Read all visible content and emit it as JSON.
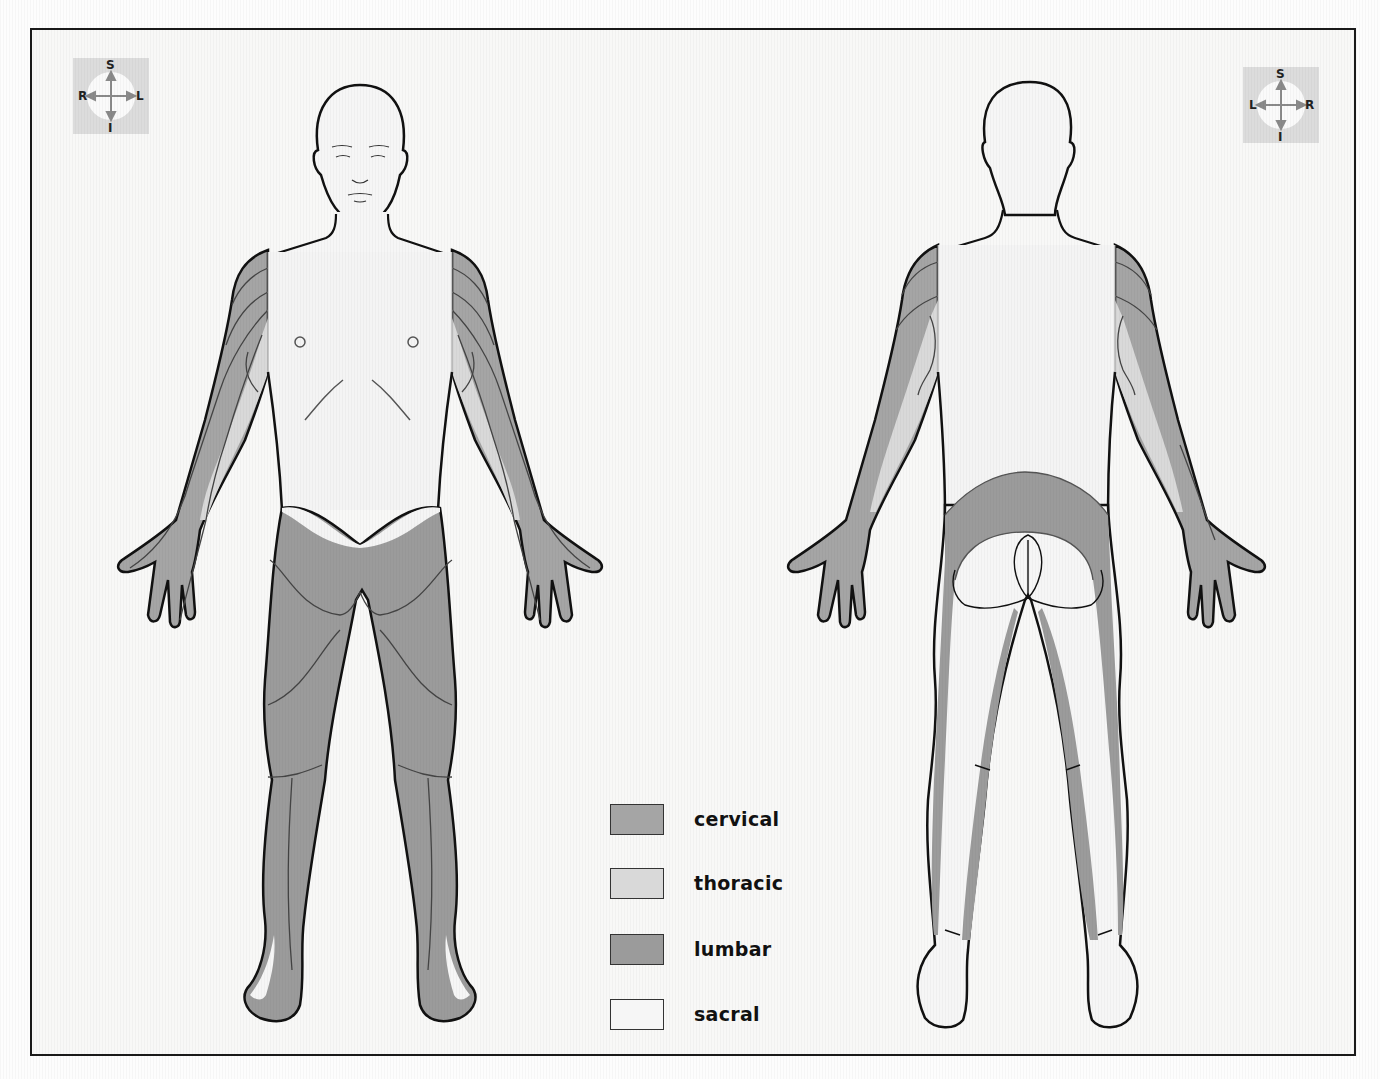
{
  "diagram": {
    "views": [
      {
        "id": "anterior",
        "label": "Anterior view"
      },
      {
        "id": "posterior",
        "label": "Posterior view"
      }
    ]
  },
  "compass_left": {
    "top": "S",
    "bottom": "I",
    "left": "R",
    "right": "L"
  },
  "compass_right": {
    "top": "S",
    "bottom": "I",
    "left": "L",
    "right": "R"
  },
  "colors": {
    "background": "#f8f8f7",
    "cervical": "#a5a5a5",
    "thoracic": "#d9d9d9",
    "lumbar": "#9b9b9b",
    "sacral": "#f6f6f6",
    "outline": "#111111"
  },
  "legend": {
    "items": [
      {
        "label": "cervical",
        "color": "#a5a5a5"
      },
      {
        "label": "thoracic",
        "color": "#d9d9d9"
      },
      {
        "label": "lumbar",
        "color": "#9b9b9b"
      },
      {
        "label": "sacral",
        "color": "#f6f6f6"
      }
    ]
  }
}
